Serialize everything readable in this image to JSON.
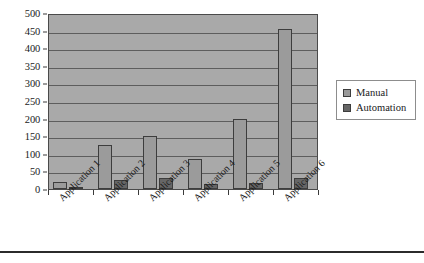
{
  "chart_data": {
    "type": "bar",
    "title": "",
    "subtitle": "",
    "xlabel": "",
    "ylabel": "",
    "categories": [
      "Application 1",
      "Application 2",
      "Application 3",
      "Application 4",
      "Application 5",
      "Application 6"
    ],
    "series": [
      {
        "name": "Manual",
        "color": "#9b9b9b",
        "values": [
          20,
          125,
          150,
          85,
          200,
          455
        ]
      },
      {
        "name": "Automation",
        "color": "#666666",
        "values": [
          3,
          25,
          32,
          15,
          18,
          30
        ]
      }
    ],
    "ylim": [
      0,
      500
    ],
    "ytick_values": [
      0,
      50,
      100,
      150,
      200,
      250,
      300,
      350,
      400,
      450,
      500
    ],
    "ytick_labels": [
      "0",
      "50",
      "100",
      "150",
      "200",
      "250",
      "300",
      "350",
      "400",
      "450",
      "500"
    ],
    "grid": true,
    "grid_axis": "y",
    "legend_position": "right",
    "plot_background": "#a9a9a9",
    "gridline_color": "#5d5d5d",
    "xtick_label_rotation": -45
  },
  "legend": {
    "entries": [
      {
        "label": "Manual"
      },
      {
        "label": "Automation"
      }
    ]
  }
}
